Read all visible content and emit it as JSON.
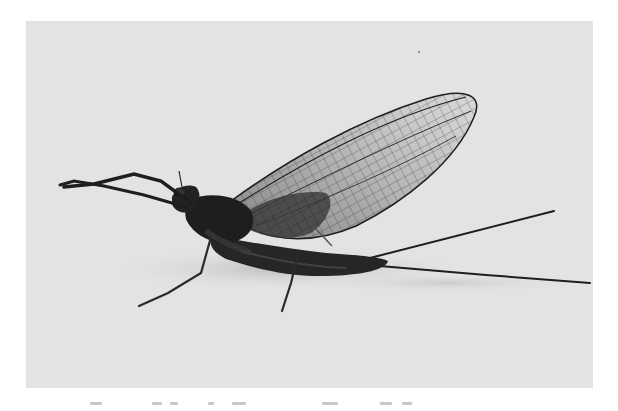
{
  "page": {
    "background": "#ffffff"
  },
  "photo": {
    "subject": "mayfly (adult, side view)",
    "style": "black-and-white photograph",
    "background_color": "#e3e3e3",
    "subject_color": "#1e1e1e",
    "wing_vein_color": "#2a2a2a",
    "elements": [
      "upright-wing",
      "hind-wing",
      "head",
      "thorax",
      "abdomen",
      "forelegs",
      "middle-leg",
      "hind-leg",
      "tail-filaments",
      "shadow"
    ]
  },
  "caption": {
    "text": "",
    "legible": false,
    "note": "caption cropped at bottom edge"
  }
}
